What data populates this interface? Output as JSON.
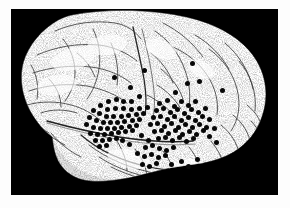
{
  "figure": {
    "kind": "anatomical-illustration",
    "view": "left lateral",
    "style": "stipple / pen-and-ink line drawing",
    "background_color": "#000000",
    "brain_fill_color": "#ffffff",
    "brain_line_color": "#3a3a3a",
    "dot_color": "#080808",
    "page_color": "#fdfdfd",
    "plate": {
      "x": 11,
      "y": 9,
      "width": 267,
      "height": 186
    },
    "caption": "",
    "labels": [],
    "legend": [],
    "annotations": [],
    "marker_count": 118,
    "marker_radius_px": 2.5,
    "regions": [
      {
        "name": "frontal-lobe",
        "marked": true
      },
      {
        "name": "precentral-gyrus",
        "marked": true
      },
      {
        "name": "postcentral-gyrus",
        "marked": true
      },
      {
        "name": "parietal-lobe",
        "marked": true
      },
      {
        "name": "temporal-lobe",
        "marked": true
      },
      {
        "name": "occipital-lobe",
        "marked": false
      },
      {
        "name": "sylvian-fissure",
        "marked": true
      },
      {
        "name": "cerebellum",
        "marked": false
      }
    ],
    "markers": [
      [
        103,
        68
      ],
      [
        133,
        61
      ],
      [
        181,
        54
      ],
      [
        188,
        72
      ],
      [
        176,
        74
      ],
      [
        164,
        83
      ],
      [
        211,
        81
      ],
      [
        119,
        78
      ],
      [
        128,
        87
      ],
      [
        120,
        92
      ],
      [
        112,
        92
      ],
      [
        105,
        90
      ],
      [
        97,
        92
      ],
      [
        89,
        96
      ],
      [
        96,
        100
      ],
      [
        104,
        99
      ],
      [
        112,
        99
      ],
      [
        120,
        100
      ],
      [
        128,
        99
      ],
      [
        136,
        98
      ],
      [
        82,
        101
      ],
      [
        88,
        104
      ],
      [
        95,
        107
      ],
      [
        102,
        107
      ],
      [
        110,
        107
      ],
      [
        117,
        106
      ],
      [
        125,
        105
      ],
      [
        132,
        104
      ],
      [
        78,
        108
      ],
      [
        85,
        111
      ],
      [
        92,
        113
      ],
      [
        99,
        113
      ],
      [
        106,
        113
      ],
      [
        113,
        112
      ],
      [
        121,
        111
      ],
      [
        128,
        110
      ],
      [
        75,
        115
      ],
      [
        82,
        118
      ],
      [
        89,
        119
      ],
      [
        96,
        119
      ],
      [
        103,
        119
      ],
      [
        110,
        118
      ],
      [
        118,
        117
      ],
      [
        125,
        116
      ],
      [
        79,
        124
      ],
      [
        86,
        125
      ],
      [
        93,
        125
      ],
      [
        100,
        124
      ],
      [
        107,
        123
      ],
      [
        114,
        122
      ],
      [
        121,
        121
      ],
      [
        84,
        131
      ],
      [
        91,
        131
      ],
      [
        98,
        130
      ],
      [
        105,
        129
      ],
      [
        88,
        137
      ],
      [
        95,
        136
      ],
      [
        148,
        94
      ],
      [
        156,
        91
      ],
      [
        163,
        97
      ],
      [
        170,
        92
      ],
      [
        177,
        96
      ],
      [
        184,
        92
      ],
      [
        145,
        101
      ],
      [
        152,
        99
      ],
      [
        159,
        103
      ],
      [
        166,
        100
      ],
      [
        173,
        104
      ],
      [
        180,
        100
      ],
      [
        187,
        103
      ],
      [
        194,
        99
      ],
      [
        142,
        108
      ],
      [
        149,
        107
      ],
      [
        156,
        110
      ],
      [
        163,
        107
      ],
      [
        170,
        111
      ],
      [
        177,
        108
      ],
      [
        184,
        111
      ],
      [
        191,
        107
      ],
      [
        198,
        110
      ],
      [
        139,
        115
      ],
      [
        146,
        114
      ],
      [
        153,
        117
      ],
      [
        160,
        114
      ],
      [
        167,
        118
      ],
      [
        174,
        115
      ],
      [
        181,
        118
      ],
      [
        188,
        115
      ],
      [
        195,
        118
      ],
      [
        143,
        122
      ],
      [
        150,
        121
      ],
      [
        157,
        124
      ],
      [
        164,
        121
      ],
      [
        171,
        125
      ],
      [
        178,
        122
      ],
      [
        185,
        125
      ],
      [
        192,
        121
      ],
      [
        147,
        129
      ],
      [
        154,
        128
      ],
      [
        161,
        131
      ],
      [
        168,
        128
      ],
      [
        175,
        132
      ],
      [
        182,
        129
      ],
      [
        137,
        131
      ],
      [
        130,
        126
      ],
      [
        134,
        138
      ],
      [
        141,
        136
      ],
      [
        148,
        139
      ],
      [
        155,
        141
      ],
      [
        162,
        138
      ],
      [
        126,
        144
      ],
      [
        133,
        147
      ],
      [
        140,
        145
      ],
      [
        147,
        148
      ],
      [
        154,
        146
      ],
      [
        131,
        155
      ],
      [
        138,
        157
      ],
      [
        145,
        154
      ],
      [
        160,
        155
      ],
      [
        170,
        152
      ],
      [
        177,
        157
      ],
      [
        186,
        150
      ],
      [
        198,
        127
      ],
      [
        205,
        133
      ],
      [
        203,
        119
      ],
      [
        118,
        135
      ],
      [
        111,
        131
      ]
    ]
  }
}
